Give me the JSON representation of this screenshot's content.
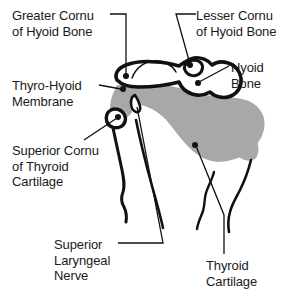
{
  "figure": {
    "background_color": "#ffffff",
    "ink_color": "#111111",
    "membrane_fill_color": "#a8a8a8",
    "bone_fill_color": "#ffffff"
  },
  "labels": {
    "greater_cornu": {
      "line1": "Greater Cornu",
      "line2": "of Hyoid Bone",
      "full": "Greater Cornu of Hyoid Bone"
    },
    "lesser_cornu": {
      "line1": "Lesser Cornu",
      "line2": "of Hyoid Bone",
      "full": "Lesser Cornu of Hyoid Bone"
    },
    "hyoid_bone": {
      "line1": "Hyoid",
      "line2": "Bone",
      "full": "Hyoid Bone"
    },
    "thyro_hyoid_membrane": {
      "line1": "Thyro-Hyoid",
      "line2": "Membrane",
      "full": "Thyro-Hyoid Membrane"
    },
    "superior_cornu_thyroid": {
      "line1": "Superior Cornu",
      "line2": "of Thyroid",
      "line3": "Cartilage",
      "full": "Superior Cornu of Thyroid Cartilage"
    },
    "superior_laryngeal_nerve": {
      "line1": "Superior",
      "line2": "Laryngeal",
      "line3": "Nerve",
      "full": "Superior Laryngeal Nerve"
    },
    "thyroid_cartilage": {
      "line1": "Thyroid",
      "line2": "Cartilage",
      "full": "Thyroid Cartilage"
    }
  },
  "structures": [
    {
      "name": "hyoid-bone",
      "fill": "#ffffff",
      "description": "Hyoid bone, lateral profile with greater and lesser cornu"
    },
    {
      "name": "thyro-hyoid-membrane",
      "fill": "#a8a8a8",
      "description": "Shaded thyro-hyoid membrane spanning hyoid bone and thyroid cartilage"
    },
    {
      "name": "thyroid-cartilage",
      "fill": "#ffffff",
      "description": "Thyroid cartilage lamina with superior cornu"
    },
    {
      "name": "superior-laryngeal-nerve",
      "fill": "none",
      "description": "Nerve piercing the thyro-hyoid membrane"
    }
  ]
}
